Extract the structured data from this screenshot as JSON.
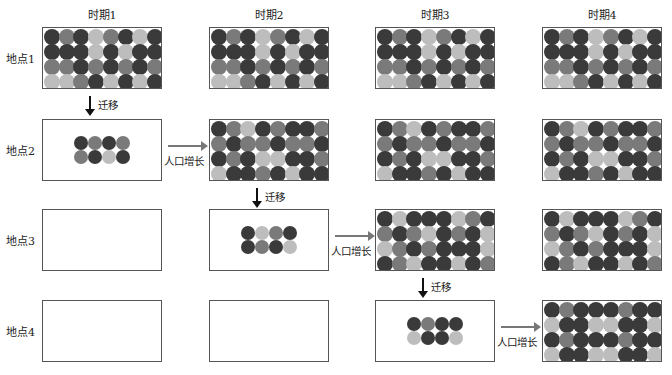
{
  "diagram": {
    "columns": [
      "时期1",
      "时期2",
      "时期3",
      "时期4"
    ],
    "rows": [
      "地点1",
      "地点2",
      "地点3",
      "地点4"
    ],
    "legend_colors": {
      "D": "#3a3a3a",
      "M": "#7a7a7a",
      "L": "#bdbdbd"
    },
    "patterns": {
      "site1": [
        [
          "D",
          "M",
          "D",
          "L",
          "M",
          "D",
          "L",
          "D"
        ],
        [
          "D",
          "D",
          "D",
          "L",
          "D",
          "L",
          "D",
          "D"
        ],
        [
          "M",
          "M",
          "D",
          "M",
          "D",
          "M",
          "D",
          "M"
        ],
        [
          "L",
          "L",
          "M",
          "D",
          "L",
          "D",
          "L",
          "D"
        ]
      ],
      "site2": [
        [
          "D",
          "M",
          "L",
          "D",
          "M",
          "D",
          "D",
          "M"
        ],
        [
          "M",
          "D",
          "M",
          "M",
          "D",
          "M",
          "M",
          "D"
        ],
        [
          "D",
          "M",
          "D",
          "L",
          "L",
          "D",
          "D",
          "M"
        ],
        [
          "L",
          "D",
          "D",
          "M",
          "D",
          "L",
          "D",
          "D"
        ]
      ],
      "site3": [
        [
          "D",
          "L",
          "D",
          "D",
          "D",
          "L",
          "M",
          "D"
        ],
        [
          "M",
          "D",
          "M",
          "L",
          "D",
          "M",
          "D",
          "L"
        ],
        [
          "L",
          "M",
          "D",
          "M",
          "D",
          "D",
          "D",
          "L"
        ],
        [
          "D",
          "M",
          "L",
          "D",
          "D",
          "L",
          "D",
          "M"
        ]
      ],
      "site4": [
        [
          "D",
          "M",
          "D",
          "D",
          "D",
          "M",
          "D",
          "D"
        ],
        [
          "L",
          "D",
          "D",
          "L",
          "L",
          "D",
          "D",
          "L"
        ],
        [
          "D",
          "M",
          "D",
          "D",
          "D",
          "M",
          "D",
          "D"
        ],
        [
          "L",
          "D",
          "D",
          "L",
          "L",
          "D",
          "D",
          "L"
        ]
      ],
      "migrants_to_site2": [
        [
          "D",
          "M",
          "D",
          "M"
        ],
        [
          "M",
          "D",
          "L",
          "D"
        ]
      ],
      "migrants_to_site3": [
        [
          "D",
          "L",
          "M",
          "D"
        ],
        [
          "D",
          "M",
          "D",
          "L"
        ]
      ],
      "migrants_to_site4": [
        [
          "D",
          "M",
          "D",
          "D"
        ],
        [
          "L",
          "D",
          "D",
          "L"
        ]
      ]
    },
    "cells": [
      {
        "row": 0,
        "col": 0,
        "type": "full",
        "pattern": "site1"
      },
      {
        "row": 0,
        "col": 1,
        "type": "full",
        "pattern": "site1"
      },
      {
        "row": 0,
        "col": 2,
        "type": "full",
        "pattern": "site1"
      },
      {
        "row": 0,
        "col": 3,
        "type": "full",
        "pattern": "site1"
      },
      {
        "row": 1,
        "col": 0,
        "type": "small",
        "pattern": "migrants_to_site2"
      },
      {
        "row": 1,
        "col": 1,
        "type": "full",
        "pattern": "site2"
      },
      {
        "row": 1,
        "col": 2,
        "type": "full",
        "pattern": "site2"
      },
      {
        "row": 1,
        "col": 3,
        "type": "full",
        "pattern": "site2"
      },
      {
        "row": 2,
        "col": 0,
        "type": "empty"
      },
      {
        "row": 2,
        "col": 1,
        "type": "small",
        "pattern": "migrants_to_site3"
      },
      {
        "row": 2,
        "col": 2,
        "type": "full",
        "pattern": "site3"
      },
      {
        "row": 2,
        "col": 3,
        "type": "full",
        "pattern": "site3"
      },
      {
        "row": 3,
        "col": 0,
        "type": "empty"
      },
      {
        "row": 3,
        "col": 1,
        "type": "empty"
      },
      {
        "row": 3,
        "col": 2,
        "type": "small",
        "pattern": "migrants_to_site4"
      },
      {
        "row": 3,
        "col": 3,
        "type": "full",
        "pattern": "site4"
      }
    ],
    "arrows": {
      "migration_label": "迁移",
      "growth_label": "人口增长",
      "migrations": [
        {
          "col": 0,
          "from_row": 0,
          "to_row": 1
        },
        {
          "col": 1,
          "from_row": 1,
          "to_row": 2
        },
        {
          "col": 2,
          "from_row": 2,
          "to_row": 3
        }
      ],
      "growths": [
        {
          "row": 1,
          "from_col": 0,
          "to_col": 1
        },
        {
          "row": 2,
          "from_col": 1,
          "to_col": 2
        },
        {
          "row": 3,
          "from_col": 2,
          "to_col": 3
        }
      ]
    }
  }
}
